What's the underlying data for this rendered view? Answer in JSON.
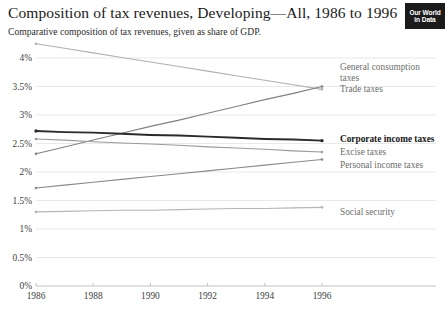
{
  "header": {
    "title": "Composition of tax revenues, Developing—All, 1986 to 1996",
    "subtitle": "Comparative composition of tax revenues, given as share of GDP."
  },
  "logo": {
    "line1": "Our World",
    "line2": "in Data"
  },
  "chart_data": {
    "type": "line",
    "title": "Composition of tax revenues, Developing—All, 1986 to 1996",
    "subtitle": "Comparative composition of tax revenues, given as share of GDP.",
    "xlabel": "",
    "ylabel": "",
    "x": [
      1986,
      1987,
      1988,
      1989,
      1990,
      1991,
      1992,
      1993,
      1994,
      1995,
      1996
    ],
    "xlim": [
      1986,
      1996
    ],
    "ylim": [
      0,
      4.25
    ],
    "xticks": [
      1986,
      1988,
      1990,
      1992,
      1994,
      1996
    ],
    "xtick_labels": [
      "1986",
      "1988",
      "1990",
      "1992",
      "1994",
      "1996"
    ],
    "yticks": [
      0,
      0.5,
      1,
      1.5,
      2,
      2.5,
      3,
      3.5,
      4
    ],
    "ytick_labels": [
      "0%",
      "0.5%",
      "1%",
      "1.5%",
      "2%",
      "2.5%",
      "3%",
      "3.5%",
      "4%"
    ],
    "grid": true,
    "legend_position": "right-inline",
    "series": [
      {
        "name": "Trade taxes",
        "label": "Trade taxes",
        "color": "#b0b0b0",
        "emphasis": false,
        "start_value": 4.25,
        "end_value": 3.45,
        "values": [
          4.25,
          4.17,
          4.09,
          4.01,
          3.93,
          3.85,
          3.77,
          3.69,
          3.61,
          3.53,
          3.45
        ]
      },
      {
        "name": "General consumption taxes",
        "label": "General consumption taxes",
        "color": "#808080",
        "emphasis": false,
        "start_value": 2.32,
        "end_value": 3.5,
        "values": [
          2.32,
          2.44,
          2.56,
          2.68,
          2.8,
          2.91,
          3.03,
          3.15,
          3.27,
          3.38,
          3.5
        ]
      },
      {
        "name": "Corporate income taxes",
        "label": "Corporate income taxes",
        "color": "#2b2b2b",
        "emphasis": true,
        "start_value": 2.72,
        "end_value": 2.55,
        "values": [
          2.72,
          2.7,
          2.69,
          2.67,
          2.65,
          2.64,
          2.62,
          2.6,
          2.58,
          2.57,
          2.55
        ]
      },
      {
        "name": "Excise taxes",
        "label": "Excise taxes",
        "color": "#9a9a9a",
        "emphasis": false,
        "start_value": 2.58,
        "end_value": 2.35,
        "values": [
          2.58,
          2.56,
          2.53,
          2.51,
          2.49,
          2.47,
          2.44,
          2.42,
          2.4,
          2.37,
          2.35
        ]
      },
      {
        "name": "Personal income taxes",
        "label": "Personal income taxes",
        "color": "#8a8a8a",
        "emphasis": false,
        "start_value": 1.72,
        "end_value": 2.22,
        "values": [
          1.72,
          1.77,
          1.82,
          1.87,
          1.92,
          1.97,
          2.02,
          2.07,
          2.12,
          2.17,
          2.22
        ]
      },
      {
        "name": "Social security",
        "label": "Social security",
        "color": "#b5b5b5",
        "emphasis": false,
        "start_value": 1.3,
        "end_value": 1.38,
        "values": [
          1.3,
          1.31,
          1.32,
          1.33,
          1.33,
          1.34,
          1.35,
          1.36,
          1.36,
          1.37,
          1.38
        ]
      }
    ],
    "series_labels_layout": [
      {
        "name": "General consumption taxes",
        "line1": "General consumption",
        "line2": "taxes"
      },
      {
        "name": "Trade taxes",
        "line1": "Trade taxes",
        "line2": ""
      },
      {
        "name": "Corporate income taxes",
        "line1": "Corporate income taxes",
        "line2": ""
      },
      {
        "name": "Excise taxes",
        "line1": "Excise taxes",
        "line2": ""
      },
      {
        "name": "Personal income taxes",
        "line1": "Personal income taxes",
        "line2": ""
      },
      {
        "name": "Social security",
        "line1": "Social security",
        "line2": ""
      }
    ]
  }
}
